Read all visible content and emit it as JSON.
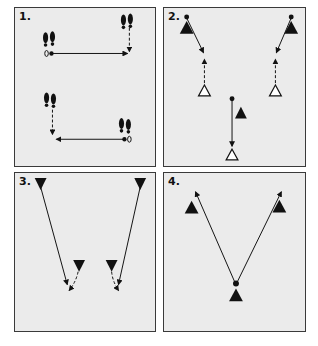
{
  "diagram": {
    "type": "drill-diagrams",
    "colors": {
      "panel_bg": "#ebebeb",
      "border": "#3a3a3a",
      "ink": "#111111",
      "open_marker": "#ffffff"
    },
    "panels": [
      {
        "id": 1,
        "label": "1.",
        "description": "Footprint shuffle: lateral moves with forward/backward dashed steps"
      },
      {
        "id": 2,
        "label": "2.",
        "description": "Players (filled triangles) run diagonally to open cones, backpedal dashed"
      },
      {
        "id": 3,
        "label": "3.",
        "description": "Inverted triangles: long diagonal runs and curved dashed cuts"
      },
      {
        "id": 4,
        "label": "4.",
        "description": "V-pattern: center player runs diagonally to two corner markers"
      }
    ]
  }
}
